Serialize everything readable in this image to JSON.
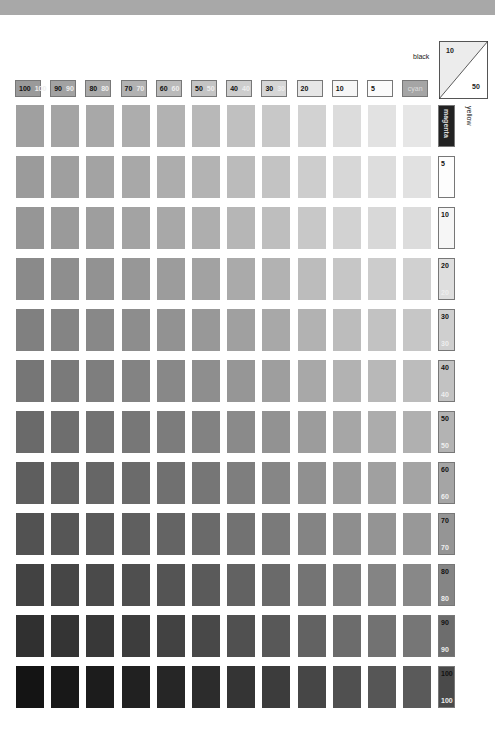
{
  "labels": {
    "black": "black",
    "yellow": "yellow",
    "cyan": "cyan",
    "magenta": "magenta",
    "diag_top": "10",
    "diag_bottom": "50"
  },
  "chart_data": {
    "type": "heatmap",
    "title": "",
    "columns": [
      "100",
      "90",
      "80",
      "70",
      "60",
      "50",
      "40",
      "30",
      "20",
      "10",
      "5",
      "cyan"
    ],
    "rows": [
      "magenta",
      "5",
      "10",
      "20",
      "30",
      "40",
      "50",
      "60",
      "70",
      "80",
      "90",
      "100"
    ],
    "header_swatch_grays": [
      "#9a9a9a",
      "#a2a2a2",
      "#aaaaaa",
      "#b2b2b2",
      "#bababa",
      "#c4c4c4",
      "#cdcdcd",
      "#d6d6d6",
      "#e6e6e6",
      "#f6f6f6",
      "#fbfbfb",
      "#a5a5a5"
    ],
    "side_swatch_grays": [
      "#222222",
      "#fdfdfd",
      "#f6f6f6",
      "#dedede",
      "#cfcfcf",
      "#c2c2c2",
      "#b3b3b3",
      "#a5a5a5",
      "#959595",
      "#858585",
      "#6d6d6d",
      "#4a4a4a"
    ],
    "grid_lightness": [
      [
        160,
        164,
        168,
        173,
        178,
        184,
        192,
        200,
        210,
        220,
        226,
        230
      ],
      [
        155,
        159,
        163,
        168,
        173,
        179,
        187,
        195,
        205,
        215,
        221,
        225
      ],
      [
        150,
        154,
        158,
        163,
        168,
        174,
        182,
        190,
        200,
        210,
        216,
        220
      ],
      [
        138,
        142,
        146,
        151,
        156,
        162,
        170,
        178,
        188,
        198,
        204,
        208
      ],
      [
        128,
        132,
        136,
        141,
        146,
        152,
        160,
        168,
        178,
        188,
        194,
        198
      ],
      [
        118,
        122,
        126,
        131,
        136,
        142,
        150,
        158,
        168,
        178,
        184,
        188
      ],
      [
        106,
        110,
        114,
        119,
        124,
        130,
        138,
        146,
        156,
        166,
        172,
        176
      ],
      [
        94,
        98,
        102,
        107,
        112,
        118,
        126,
        134,
        144,
        154,
        160,
        164
      ],
      [
        82,
        86,
        90,
        95,
        100,
        106,
        114,
        122,
        132,
        142,
        148,
        152
      ],
      [
        66,
        70,
        74,
        79,
        84,
        90,
        98,
        106,
        116,
        126,
        132,
        136
      ],
      [
        48,
        52,
        56,
        61,
        66,
        72,
        80,
        88,
        98,
        108,
        114,
        118
      ],
      [
        20,
        24,
        28,
        33,
        38,
        44,
        52,
        60,
        70,
        80,
        86,
        90
      ]
    ],
    "xlabel": "cyan %",
    "ylabel": "magenta %",
    "note": "black 10 / yellow 50"
  }
}
